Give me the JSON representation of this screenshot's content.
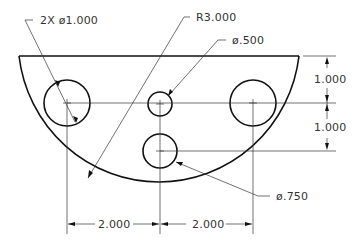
{
  "diagram": {
    "type": "engineering-drawing",
    "part": "half-circle plate with holes",
    "annotations": {
      "holes_large": "2X ø1.000",
      "radius": "R3.000",
      "hole_small": "ø.500",
      "hole_medium": "ø.750"
    },
    "dimensions": {
      "vertical_top": "1.000",
      "vertical_bottom": "1.000",
      "horizontal_left": "2.000",
      "horizontal_right": "2.000"
    },
    "colors": {
      "object_line": "#111111",
      "dimension_line": "#333333",
      "background": "#ffffff"
    }
  }
}
